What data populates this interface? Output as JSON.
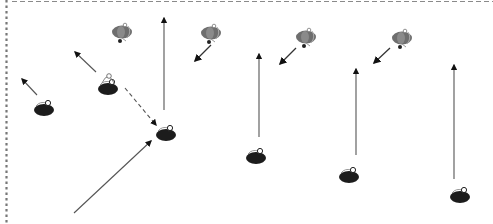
{
  "diagram": {
    "type": "soccer-drill",
    "border": {
      "top_style": "dashed",
      "left_style": "dotted",
      "color": "#8a8a8a"
    },
    "colors": {
      "team_dark": "#1c1c1c",
      "team_gray": "#6e6e6e",
      "run_arrow": "#555555",
      "pass_arrow": "#555555",
      "defender_arrow": "#333333"
    },
    "players": [
      {
        "id": "d1",
        "team": "dark",
        "x": 44,
        "y": 107,
        "with_ball": false
      },
      {
        "id": "d2",
        "team": "dark",
        "x": 108,
        "y": 86,
        "with_ball": true
      },
      {
        "id": "d3",
        "team": "dark",
        "x": 166,
        "y": 132,
        "with_ball": false
      },
      {
        "id": "d4",
        "team": "dark",
        "x": 256,
        "y": 155,
        "with_ball": false
      },
      {
        "id": "d5",
        "team": "dark",
        "x": 349,
        "y": 174,
        "with_ball": false
      },
      {
        "id": "d6",
        "team": "dark",
        "x": 460,
        "y": 194,
        "with_ball": false
      },
      {
        "id": "g1",
        "team": "gray",
        "x": 122,
        "y": 32,
        "with_ball": false
      },
      {
        "id": "g2",
        "team": "gray",
        "x": 211,
        "y": 33,
        "with_ball": false
      },
      {
        "id": "g3",
        "team": "gray",
        "x": 306,
        "y": 37,
        "with_ball": false
      },
      {
        "id": "g4",
        "team": "gray",
        "x": 402,
        "y": 38,
        "with_ball": false
      }
    ],
    "arrows": [
      {
        "id": "a1",
        "kind": "run",
        "x1": 37,
        "y1": 95,
        "x2": 22,
        "y2": 79
      },
      {
        "id": "a2",
        "kind": "run",
        "x1": 96,
        "y1": 72,
        "x2": 75,
        "y2": 52
      },
      {
        "id": "a3",
        "kind": "pass",
        "x1": 125,
        "y1": 88,
        "x2": 156,
        "y2": 125
      },
      {
        "id": "a4",
        "kind": "run",
        "x1": 164,
        "y1": 110,
        "x2": 164,
        "y2": 18
      },
      {
        "id": "a5",
        "kind": "run",
        "x1": 74,
        "y1": 213,
        "x2": 151,
        "y2": 141
      },
      {
        "id": "a6",
        "kind": "run",
        "x1": 259,
        "y1": 137,
        "x2": 259,
        "y2": 54
      },
      {
        "id": "a7",
        "kind": "run",
        "x1": 356,
        "y1": 155,
        "x2": 356,
        "y2": 69
      },
      {
        "id": "a8",
        "kind": "run",
        "x1": 454,
        "y1": 179,
        "x2": 454,
        "y2": 65
      },
      {
        "id": "a9",
        "kind": "defender",
        "x1": 211,
        "y1": 45,
        "x2": 195,
        "y2": 61
      },
      {
        "id": "a10",
        "kind": "defender",
        "x1": 296,
        "y1": 48,
        "x2": 280,
        "y2": 64
      },
      {
        "id": "a11",
        "kind": "defender",
        "x1": 390,
        "y1": 48,
        "x2": 374,
        "y2": 63
      }
    ]
  }
}
